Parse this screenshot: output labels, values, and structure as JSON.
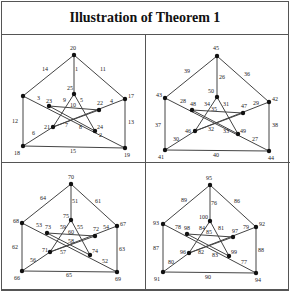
{
  "title": "Illustration of Theorem 1",
  "panels": [
    {
      "vertices": {
        "outer_top": "20",
        "outer_left": "",
        "outer_right": "17",
        "outer_bottom_right": "19",
        "outer_bottom_left": "18",
        "inner_top": "25",
        "inner_left": "23",
        "inner_right": "22",
        "inner_bottom_right": "24",
        "inner_bottom_left": "21"
      },
      "edges": {
        "top_left": "14",
        "top_right": "11",
        "spoke_top": "1",
        "left_side": "12",
        "right_side": "13",
        "bottom": "15",
        "spoke_bottom_left": "6",
        "spoke_bottom_right": "2",
        "spoke_left": "3",
        "spoke_right": "4",
        "star_a": "9",
        "star_b": "10",
        "star_c": "5",
        "star_d": "7",
        "star_e": "8"
      }
    },
    {
      "vertices": {
        "outer_top": "45",
        "outer_left": "43",
        "outer_right": "42",
        "outer_bottom_right": "44",
        "outer_bottom_left": "41",
        "inner_top": "50",
        "inner_left": "48",
        "inner_right": "47",
        "inner_bottom_right": "49",
        "inner_bottom_left": "46"
      },
      "edges": {
        "top_left": "39",
        "top_right": "36",
        "spoke_top": "26",
        "left_side": "37",
        "right_side": "38",
        "bottom": "40",
        "spoke_bottom_left": "30",
        "spoke_bottom_right": "27",
        "spoke_left": "28",
        "spoke_right": "29",
        "star_a": "34",
        "star_b": "35",
        "star_c": "31",
        "star_d": "32",
        "star_e": "33"
      }
    },
    {
      "vertices": {
        "outer_top": "70",
        "outer_left": "68",
        "outer_right": "67",
        "outer_bottom_right": "69",
        "outer_bottom_left": "66",
        "inner_top": "75",
        "inner_left": "73",
        "inner_right": "72",
        "inner_bottom_right": "74",
        "inner_bottom_left": "71"
      },
      "edges": {
        "top_left": "64",
        "top_right": "61",
        "spoke_top": "51",
        "left_side": "62",
        "right_side": "63",
        "bottom": "65",
        "spoke_bottom_left": "56",
        "spoke_bottom_right": "52",
        "spoke_left": "53",
        "spoke_right": "54",
        "star_a": "59",
        "star_b": "60",
        "star_c": "55",
        "star_d": "57",
        "star_e": "58"
      }
    },
    {
      "vertices": {
        "outer_top": "95",
        "outer_left": "93",
        "outer_right": "92",
        "outer_bottom_right": "94",
        "outer_bottom_left": "91",
        "inner_top": "100",
        "inner_left": "98",
        "inner_right": "97",
        "inner_bottom_right": "99",
        "inner_bottom_left": "96"
      },
      "edges": {
        "top_left": "89",
        "top_right": "86",
        "spoke_top": "76",
        "left_side": "87",
        "right_side": "88",
        "bottom": "90",
        "spoke_bottom_left": "80",
        "spoke_bottom_right": "77",
        "spoke_left": "78",
        "spoke_right": "79",
        "star_a": "84",
        "star_b": "85",
        "star_c": "81",
        "star_d": "82",
        "star_e": "83"
      }
    }
  ]
}
